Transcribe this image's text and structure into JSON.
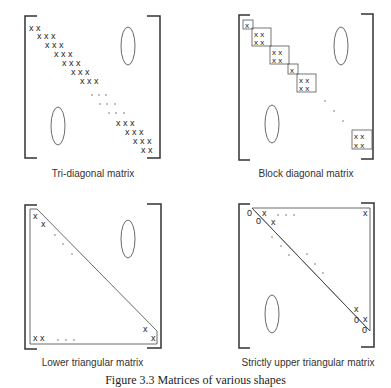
{
  "panels": [
    {
      "id": "tri-diagonal",
      "label": "Tri-diagonal matrix"
    },
    {
      "id": "block-diagonal",
      "label": "Block diagonal matrix"
    },
    {
      "id": "lower-triangular",
      "label": "Lower triangular matrix"
    },
    {
      "id": "strictly-upper-triangular",
      "label": "Strictly upper triangular matrix"
    }
  ],
  "glyphs": {
    "x": "x",
    "zero": "0",
    "dots": ". . ."
  },
  "caption": "Figure 3.3  Matrices of various shapes"
}
